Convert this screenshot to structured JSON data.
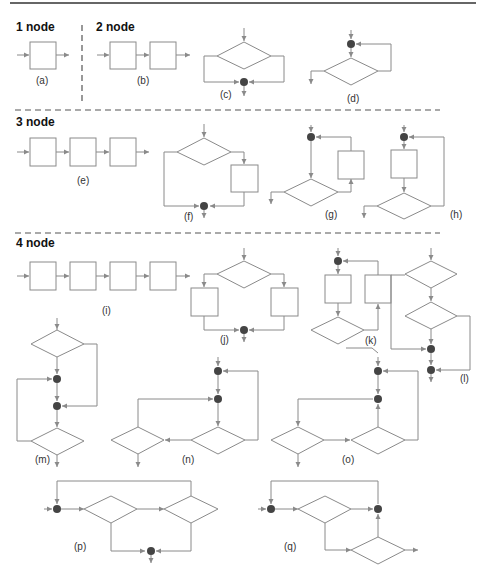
{
  "sections": {
    "one_node": "1 node",
    "two_node": "2 node",
    "three_node": "3 node",
    "four_node": "4 node"
  },
  "labels": {
    "a": "(a)",
    "b": "(b)",
    "c": "(c)",
    "d": "(d)",
    "e": "(e)",
    "f": "(f)",
    "g": "(g)",
    "h": "(h)",
    "i": "(i)",
    "j": "(j)",
    "k": "(k)",
    "l": "(l)",
    "m": "(m)",
    "n": "(n)",
    "o": "(o)",
    "p": "(p)",
    "q": "(q)"
  },
  "colors": {
    "line": "#8a8a8a",
    "junction": "#444444",
    "divider": "#555555"
  }
}
